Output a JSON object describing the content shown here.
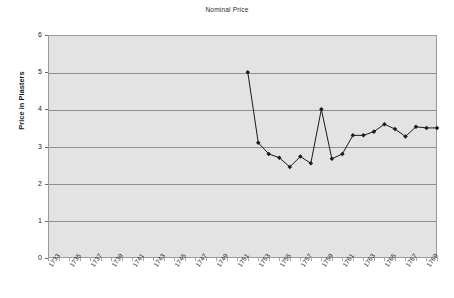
{
  "chart_data": {
    "type": "line",
    "title": "Nominal Price",
    "xlabel": "",
    "ylabel": "Price in Piasters",
    "ylim": [
      0,
      6
    ],
    "ytick_labels": [
      "0",
      "1",
      "2",
      "3",
      "4",
      "5",
      "6"
    ],
    "ytick_values": [
      0,
      1,
      2,
      3,
      4,
      5,
      6
    ],
    "xlim": [
      1733,
      1770
    ],
    "xtick_labels": [
      "1733",
      "1735",
      "1737",
      "1739",
      "1741",
      "1743",
      "1745",
      "1747",
      "1749",
      "1751",
      "1753",
      "1755",
      "1757",
      "1759",
      "1761",
      "1763",
      "1765",
      "1767",
      "1769"
    ],
    "xtick_values": [
      1733,
      1735,
      1737,
      1739,
      1741,
      1743,
      1745,
      1747,
      1749,
      1751,
      1753,
      1755,
      1757,
      1759,
      1761,
      1763,
      1765,
      1767,
      1769
    ],
    "grid": "horizontal",
    "legend": "none",
    "marker": "filled-diamond",
    "line_color": "#1a1a1a",
    "marker_color": "#1a1a1a",
    "plot_background": "#e3e3e3",
    "gridline_color": "#8f8f8f",
    "series": [
      {
        "name": "Nominal Price",
        "x": [
          1752,
          1753,
          1754,
          1755,
          1756,
          1757,
          1758,
          1759,
          1760,
          1761,
          1762,
          1763,
          1764,
          1765,
          1766,
          1767,
          1768,
          1769,
          1770
        ],
        "values": [
          5.0,
          3.1,
          2.8,
          2.7,
          2.45,
          2.73,
          2.55,
          4.0,
          2.67,
          2.8,
          3.3,
          3.3,
          3.4,
          3.6,
          3.47,
          3.27,
          3.53,
          3.5,
          3.5
        ]
      }
    ]
  }
}
